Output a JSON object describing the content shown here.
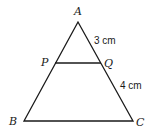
{
  "diagram": {
    "type": "triangle",
    "vertices": {
      "A": {
        "label": "A",
        "x": 78,
        "y": 22
      },
      "B": {
        "label": "B",
        "x": 24,
        "y": 121
      },
      "C": {
        "label": "C",
        "x": 133,
        "y": 121
      },
      "P": {
        "label": "P",
        "x": 55,
        "y": 63
      },
      "Q": {
        "label": "Q",
        "x": 101,
        "y": 63
      }
    },
    "measurements": {
      "AQ": "3 cm",
      "QC": "4 cm"
    },
    "colors": {
      "stroke": "#1a1a1a",
      "background": "#ffffff"
    }
  }
}
